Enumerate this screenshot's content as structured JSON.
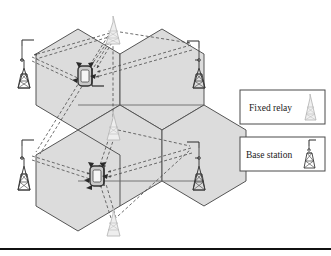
{
  "figure": {
    "type": "network-topology-diagram",
    "background_color": "#ffffff",
    "cell_fill_color": "#dcdcdc",
    "cell_stroke_color": "#555555",
    "link_color": "#444444",
    "rule_color": "#111111"
  },
  "legend": {
    "position": "right",
    "items": [
      {
        "label": "Fixed relay",
        "icon": "relay-tower-icon",
        "icon_style": "light-gray",
        "icon_color": "#b9b9b9",
        "box_border_color": "#4a4a4a"
      },
      {
        "label": "Base station",
        "icon": "base-station-tower-icon",
        "icon_style": "dark",
        "icon_color": "#3a3a3a",
        "box_border_color": "#4a4a4a"
      }
    ]
  },
  "cells": [
    {
      "name": "cell-upper-left",
      "center_x": 78,
      "center_y": 83
    },
    {
      "name": "cell-upper-right",
      "center_x": 162,
      "center_y": 83
    },
    {
      "name": "cell-lower-left",
      "center_x": 78,
      "center_y": 168
    },
    {
      "name": "cell-lower-right",
      "center_x": 162,
      "center_y": 168
    },
    {
      "name": "cell-center",
      "center_x": 120,
      "center_y": 126
    }
  ],
  "base_stations": [
    {
      "name": "base-station-upper-left",
      "x": 24,
      "y": 62
    },
    {
      "name": "base-station-upper-right",
      "x": 199,
      "y": 62
    },
    {
      "name": "base-station-lower-left",
      "x": 24,
      "y": 160
    },
    {
      "name": "base-station-lower-right",
      "x": 199,
      "y": 160
    }
  ],
  "fixed_relays": [
    {
      "name": "fixed-relay-top",
      "x": 113,
      "y": 28
    },
    {
      "name": "fixed-relay-middle",
      "x": 113,
      "y": 126
    },
    {
      "name": "fixed-relay-bottom",
      "x": 113,
      "y": 222
    }
  ],
  "mobile_stations": [
    {
      "name": "mobile-station-upper",
      "x": 85,
      "y": 76
    },
    {
      "name": "mobile-station-lower",
      "x": 97,
      "y": 176
    }
  ],
  "links": {
    "style": "dashed-arrow",
    "description": "Bidirectional dashed links connect base stations and fixed relays to mobile stations"
  }
}
